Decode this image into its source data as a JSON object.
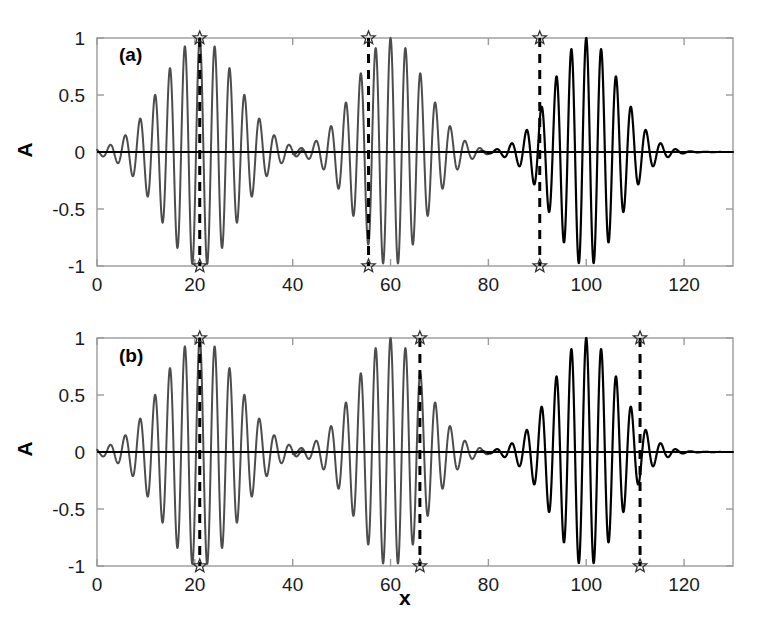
{
  "figure": {
    "background": "#ffffff",
    "width": 765,
    "height": 623,
    "xlabel": "x",
    "ylabel_a": "A",
    "ylabel_b": "A"
  },
  "chart_data": [
    {
      "type": "line",
      "panel": "a",
      "panel_label": "(a)",
      "title": "",
      "xlabel": "",
      "ylabel": "A",
      "xlim": [
        0,
        130
      ],
      "ylim": [
        -1,
        1
      ],
      "xticks": [
        0,
        20,
        40,
        60,
        80,
        100,
        120
      ],
      "xticklabels": [
        "0",
        "20",
        "40",
        "60",
        "80",
        "100",
        "120"
      ],
      "yticks": [
        -1,
        -0.5,
        0,
        0.5,
        1
      ],
      "yticklabels": [
        "-1",
        "-0.5",
        "0",
        "0.5",
        "1"
      ],
      "grid": false,
      "legend": null,
      "series": [
        {
          "name": "packet-1",
          "color": "#4d4d4d",
          "linewidth": 2.0,
          "description": "Gaussian-enveloped oscillatory wave packet",
          "center": 21.0,
          "envelope_width": 11.0,
          "wavelength": 3.05,
          "phase": 0.0,
          "amplitude": 1.0,
          "x_start": 0.0,
          "x_end": 42.0
        },
        {
          "name": "packet-2",
          "color": "#4d4d4d",
          "linewidth": 2.0,
          "description": "Gaussian-enveloped oscillatory wave packet",
          "center": 60.0,
          "envelope_width": 10.0,
          "wavelength": 3.05,
          "phase": 0.0,
          "amplitude": 1.0,
          "x_start": 40.0,
          "x_end": 80.0
        },
        {
          "name": "packet-3",
          "color": "#000000",
          "linewidth": 2.2,
          "description": "Gaussian-enveloped oscillatory wave packet",
          "center": 100.0,
          "envelope_width": 9.5,
          "wavelength": 3.05,
          "phase": 0.0,
          "amplitude": 1.0,
          "x_start": 78.0,
          "x_end": 130.0
        }
      ],
      "baseline": {
        "y": 0,
        "color": "#000000",
        "linewidth": 2.2
      },
      "markers": [
        {
          "name": "marker-1",
          "x": 21.0,
          "y_top": 1.0,
          "y_bottom": -1.0,
          "glyph": "star",
          "color": "#333333"
        },
        {
          "name": "marker-2",
          "x": 55.5,
          "y_top": 1.0,
          "y_bottom": -1.0,
          "glyph": "star",
          "color": "#333333"
        },
        {
          "name": "marker-3",
          "x": 90.5,
          "y_top": 1.0,
          "y_bottom": -1.0,
          "glyph": "star",
          "color": "#333333"
        }
      ],
      "vlines": [
        {
          "name": "vline-1",
          "x": 21.0,
          "style": "dashed",
          "color": "#000000",
          "linewidth": 3
        },
        {
          "name": "vline-2",
          "x": 55.5,
          "style": "dashed",
          "color": "#000000",
          "linewidth": 3
        },
        {
          "name": "vline-3",
          "x": 90.5,
          "style": "dashed",
          "color": "#000000",
          "linewidth": 3
        }
      ]
    },
    {
      "type": "line",
      "panel": "b",
      "panel_label": "(b)",
      "title": "",
      "xlabel": "x",
      "ylabel": "A",
      "xlim": [
        0,
        130
      ],
      "ylim": [
        -1,
        1
      ],
      "xticks": [
        0,
        20,
        40,
        60,
        80,
        100,
        120
      ],
      "xticklabels": [
        "0",
        "20",
        "40",
        "60",
        "80",
        "100",
        "120"
      ],
      "yticks": [
        -1,
        -0.5,
        0,
        0.5,
        1
      ],
      "yticklabels": [
        "-1",
        "-0.5",
        "0",
        "0.5",
        "1"
      ],
      "grid": false,
      "legend": null,
      "series": [
        {
          "name": "packet-1",
          "color": "#4d4d4d",
          "linewidth": 2.0,
          "description": "Gaussian-enveloped oscillatory wave packet",
          "center": 21.0,
          "envelope_width": 11.0,
          "wavelength": 3.05,
          "phase": 0.0,
          "amplitude": 1.0,
          "x_start": 0.0,
          "x_end": 42.0
        },
        {
          "name": "packet-2",
          "color": "#4d4d4d",
          "linewidth": 2.0,
          "description": "Gaussian-enveloped oscillatory wave packet",
          "center": 60.0,
          "envelope_width": 10.0,
          "wavelength": 3.05,
          "phase": 0.0,
          "amplitude": 1.0,
          "x_start": 40.0,
          "x_end": 80.0
        },
        {
          "name": "packet-3",
          "color": "#000000",
          "linewidth": 2.2,
          "description": "Gaussian-enveloped oscillatory wave packet",
          "center": 100.0,
          "envelope_width": 9.5,
          "wavelength": 3.05,
          "phase": 0.0,
          "amplitude": 1.0,
          "x_start": 78.0,
          "x_end": 130.0
        }
      ],
      "baseline": {
        "y": 0,
        "color": "#000000",
        "linewidth": 2.2
      },
      "markers": [
        {
          "name": "marker-1",
          "x": 21.0,
          "y_top": 1.0,
          "y_bottom": -1.0,
          "glyph": "star",
          "color": "#333333"
        },
        {
          "name": "marker-2",
          "x": 66.0,
          "y_top": 1.0,
          "y_bottom": -1.0,
          "glyph": "star",
          "color": "#333333"
        },
        {
          "name": "marker-3",
          "x": 111.0,
          "y_top": 1.0,
          "y_bottom": -1.0,
          "glyph": "star",
          "color": "#333333"
        }
      ],
      "vlines": [
        {
          "name": "vline-1",
          "x": 21.0,
          "style": "dashed",
          "color": "#000000",
          "linewidth": 3
        },
        {
          "name": "vline-2",
          "x": 66.0,
          "style": "dashed",
          "color": "#000000",
          "linewidth": 3
        },
        {
          "name": "vline-3",
          "x": 111.0,
          "style": "dashed",
          "color": "#000000",
          "linewidth": 3
        }
      ]
    }
  ]
}
